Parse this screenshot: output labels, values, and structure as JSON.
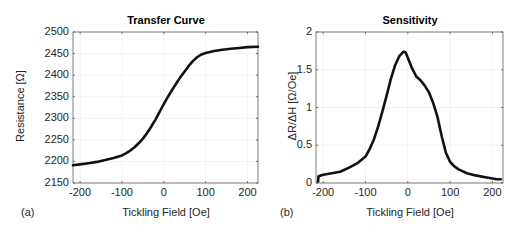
{
  "chart_data": [
    {
      "type": "line",
      "panel_label": "(a)",
      "title": "Transfer Curve",
      "xlabel": "Tickling Field [Oe]",
      "ylabel": "Resistance [Ω]",
      "xlim": [
        -217,
        225
      ],
      "ylim": [
        2150,
        2500
      ],
      "xticks": [
        -200,
        -100,
        0,
        100,
        200
      ],
      "yticks": [
        2150,
        2200,
        2250,
        2300,
        2350,
        2400,
        2450,
        2500
      ],
      "grid": true,
      "series": [
        {
          "name": "Resistance",
          "x": [
            -217,
            -200,
            -180,
            -160,
            -140,
            -120,
            -100,
            -90,
            -80,
            -70,
            -60,
            -50,
            -40,
            -30,
            -20,
            -10,
            0,
            10,
            20,
            30,
            40,
            50,
            60,
            70,
            80,
            90,
            100,
            120,
            140,
            160,
            180,
            200,
            225
          ],
          "y": [
            2191,
            2193,
            2196,
            2199,
            2203,
            2208,
            2214,
            2219,
            2225,
            2233,
            2242,
            2253,
            2266,
            2281,
            2297,
            2315,
            2333,
            2350,
            2366,
            2381,
            2396,
            2409,
            2422,
            2433,
            2442,
            2448,
            2451,
            2456,
            2459,
            2461,
            2463,
            2465,
            2466
          ]
        }
      ]
    },
    {
      "type": "line",
      "panel_label": "(b)",
      "title": "Sensitivity",
      "xlabel": "Tickling Field [Oe]",
      "ylabel": "ΔR/ΔH [Ω/Oe]",
      "xlim": [
        -217,
        225
      ],
      "ylim": [
        0,
        2
      ],
      "xticks": [
        -200,
        -100,
        0,
        100,
        200
      ],
      "yticks": [
        0,
        0.5,
        1,
        1.5,
        2
      ],
      "ytick_labels": [
        "0",
        "0.5",
        "1",
        "1.5",
        "2"
      ],
      "grid": true,
      "series": [
        {
          "name": "Sensitivity",
          "x": [
            -212,
            -211,
            -200,
            -180,
            -160,
            -140,
            -120,
            -100,
            -90,
            -80,
            -70,
            -60,
            -50,
            -40,
            -30,
            -20,
            -10,
            -5,
            0,
            10,
            20,
            30,
            40,
            50,
            60,
            70,
            80,
            90,
            100,
            110,
            120,
            140,
            160,
            180,
            200,
            210,
            220
          ],
          "y": [
            0.02,
            0.09,
            0.11,
            0.13,
            0.15,
            0.2,
            0.26,
            0.35,
            0.45,
            0.58,
            0.75,
            0.95,
            1.16,
            1.38,
            1.56,
            1.68,
            1.74,
            1.73,
            1.66,
            1.52,
            1.41,
            1.36,
            1.29,
            1.2,
            1.06,
            0.88,
            0.62,
            0.4,
            0.28,
            0.22,
            0.18,
            0.13,
            0.1,
            0.08,
            0.06,
            0.05,
            0.05
          ]
        }
      ]
    }
  ]
}
